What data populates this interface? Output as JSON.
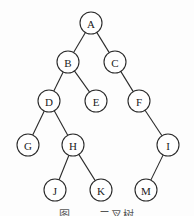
{
  "diagram": {
    "type": "binary-tree",
    "nodes": [
      {
        "id": "A",
        "label": "A",
        "x": 91,
        "y": 23
      },
      {
        "id": "B",
        "label": "B",
        "x": 68,
        "y": 62
      },
      {
        "id": "C",
        "label": "C",
        "x": 115,
        "y": 62
      },
      {
        "id": "D",
        "label": "D",
        "x": 49,
        "y": 101
      },
      {
        "id": "E",
        "label": "E",
        "x": 96,
        "y": 101
      },
      {
        "id": "F",
        "label": "F",
        "x": 139,
        "y": 101
      },
      {
        "id": "G",
        "label": "G",
        "x": 28,
        "y": 145
      },
      {
        "id": "H",
        "label": "H",
        "x": 73,
        "y": 145
      },
      {
        "id": "I",
        "label": "I",
        "x": 168,
        "y": 145
      },
      {
        "id": "J",
        "label": "J",
        "x": 55,
        "y": 190
      },
      {
        "id": "K",
        "label": "K",
        "x": 101,
        "y": 190
      },
      {
        "id": "M",
        "label": "M",
        "x": 146,
        "y": 190
      }
    ],
    "edges": [
      [
        "A",
        "B"
      ],
      [
        "A",
        "C"
      ],
      [
        "B",
        "D"
      ],
      [
        "B",
        "E"
      ],
      [
        "C",
        "F"
      ],
      [
        "D",
        "G"
      ],
      [
        "D",
        "H"
      ],
      [
        "F",
        "I"
      ],
      [
        "H",
        "J"
      ],
      [
        "H",
        "K"
      ],
      [
        "I",
        "M"
      ]
    ],
    "node_radius": 11,
    "caption": "图 ……二叉树"
  }
}
